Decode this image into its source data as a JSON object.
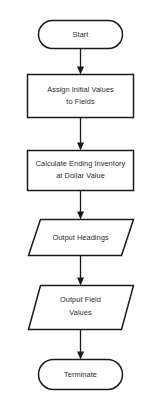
{
  "diagram": {
    "type": "flowchart",
    "colors": {
      "background": "#ffffff",
      "stroke": "#1a1a1a",
      "text": "#2b2b2b",
      "shape_fill": "#ffffff"
    },
    "nodes": [
      {
        "id": "start",
        "shape": "terminator",
        "lines": [
          "Start"
        ]
      },
      {
        "id": "assign-initial-values",
        "shape": "process",
        "lines": [
          "Assign Initial Values",
          "to Fields"
        ]
      },
      {
        "id": "calculate-ending-inventory",
        "shape": "process",
        "lines": [
          "Calculate Ending Inventory",
          "at Dollar Value"
        ]
      },
      {
        "id": "output-headings",
        "shape": "input-output",
        "lines": [
          "Output Headings"
        ]
      },
      {
        "id": "output-field-values",
        "shape": "input-output",
        "lines": [
          "Output Field",
          "Values"
        ]
      },
      {
        "id": "terminate",
        "shape": "terminator",
        "lines": [
          "Terminate"
        ]
      }
    ],
    "connectors": [
      {
        "id": "start-to-assign",
        "from": "start",
        "to": "assign-initial-values",
        "arrow": "down"
      },
      {
        "id": "assign-to-calculate",
        "from": "assign-initial-values",
        "to": "calculate-ending-inventory",
        "arrow": "down"
      },
      {
        "id": "calculate-to-headings",
        "from": "calculate-ending-inventory",
        "to": "output-headings",
        "arrow": "down"
      },
      {
        "id": "headings-to-values",
        "from": "output-headings",
        "to": "output-field-values",
        "arrow": "down"
      },
      {
        "id": "values-to-terminate",
        "from": "output-field-values",
        "to": "terminate",
        "arrow": "down"
      }
    ]
  }
}
